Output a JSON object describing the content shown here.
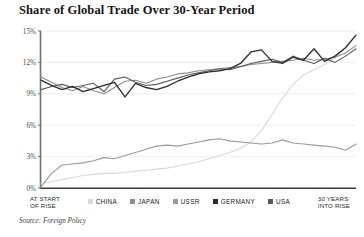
{
  "chart_data": {
    "type": "line",
    "title": "Share of Global Trade Over 30-Year Period",
    "xlabel": "",
    "ylabel": "",
    "ylim": [
      0,
      15
    ],
    "xlim": [
      0,
      30
    ],
    "grid": true,
    "legend_position": "bottom",
    "yticks": [
      "0%",
      "3%",
      "6%",
      "9%",
      "12%",
      "15%"
    ],
    "ytick_values": [
      0,
      3,
      6,
      9,
      12,
      15
    ],
    "x_axis_start_label": "AT START OF RISE",
    "x_axis_end_label": "30 YEARS INTO RISE",
    "x": [
      0,
      1,
      2,
      3,
      4,
      5,
      6,
      7,
      8,
      9,
      10,
      11,
      12,
      13,
      14,
      15,
      16,
      17,
      18,
      19,
      20,
      21,
      22,
      23,
      24,
      25,
      26,
      27,
      28,
      29,
      30
    ],
    "series": [
      {
        "name": "CHINA",
        "color": "#d9d9d9",
        "values": [
          0.4,
          0.6,
          0.8,
          1.0,
          1.2,
          1.3,
          1.4,
          1.4,
          1.5,
          1.6,
          1.7,
          1.8,
          1.9,
          2.1,
          2.3,
          2.5,
          2.8,
          3.1,
          3.4,
          3.8,
          4.4,
          5.5,
          7.0,
          8.6,
          9.9,
          10.8,
          11.3,
          11.8,
          12.4,
          13.4,
          14.6
        ]
      },
      {
        "name": "JAPAN",
        "color": "#8c8c8c",
        "values": [
          10.6,
          10.1,
          9.6,
          9.3,
          9.7,
          9.3,
          9.0,
          9.6,
          10.2,
          10.3,
          10.0,
          10.4,
          10.6,
          10.9,
          11.0,
          11.2,
          11.3,
          11.4,
          11.5,
          11.6,
          11.8,
          11.9,
          12.0,
          12.1,
          12.2,
          12.4,
          12.2,
          12.3,
          12.5,
          12.9,
          13.6
        ]
      },
      {
        "name": "USSR",
        "color": "#9a9a9a",
        "values": [
          0.1,
          1.4,
          2.2,
          2.3,
          2.4,
          2.6,
          2.9,
          2.8,
          3.1,
          3.4,
          3.7,
          4.0,
          4.1,
          4.0,
          4.2,
          4.4,
          4.6,
          4.7,
          4.5,
          4.4,
          4.3,
          4.2,
          4.3,
          4.6,
          4.3,
          4.2,
          4.1,
          4.0,
          3.9,
          3.6,
          4.2
        ]
      },
      {
        "name": "GERMANY",
        "color": "#2e2e2e",
        "values": [
          10.3,
          9.8,
          9.4,
          9.7,
          9.2,
          9.5,
          9.8,
          10.1,
          8.7,
          10.0,
          9.6,
          9.4,
          9.7,
          10.2,
          10.6,
          10.9,
          11.1,
          11.2,
          11.4,
          11.9,
          13.0,
          13.2,
          12.1,
          11.9,
          12.5,
          12.2,
          13.3,
          12.1,
          12.6,
          13.4,
          14.6
        ]
      },
      {
        "name": "USA",
        "color": "#5a5a5a",
        "values": [
          9.4,
          9.7,
          9.9,
          9.6,
          9.8,
          10.0,
          9.2,
          10.4,
          10.6,
          10.1,
          9.8,
          9.9,
          10.2,
          10.5,
          10.8,
          11.0,
          11.2,
          11.4,
          11.3,
          11.6,
          11.9,
          12.1,
          12.3,
          12.0,
          12.6,
          12.2,
          11.9,
          12.4,
          12.0,
          12.6,
          13.3
        ]
      }
    ]
  },
  "source": {
    "text": "Source: Foreign Policy"
  },
  "legend": {
    "items": [
      {
        "label": "CHINA"
      },
      {
        "label": "JAPAN"
      },
      {
        "label": "USSR"
      },
      {
        "label": "GERMANY"
      },
      {
        "label": "USA"
      }
    ]
  },
  "axis_labels": {
    "start_line1": "AT START",
    "start_line2": "OF RISE",
    "end_line1": "30 YEARS",
    "end_line2": "INTO RISE"
  }
}
